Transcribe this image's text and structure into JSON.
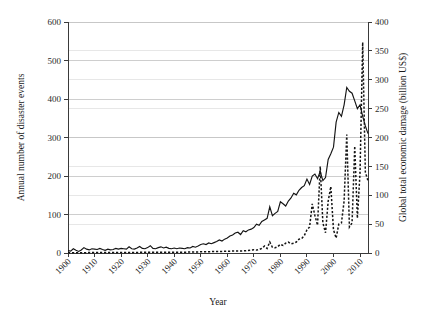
{
  "chart_data": {
    "type": "line",
    "title": "",
    "xlabel": "Year",
    "ylabel": "Annual number of disaster events",
    "ylabel_right": "Global total economic damage (billion US$)",
    "xlim": [
      1900,
      2013
    ],
    "ylim": [
      0,
      600
    ],
    "ylim_right": [
      0,
      400
    ],
    "xticks": [
      1900,
      1910,
      1920,
      1930,
      1940,
      1950,
      1960,
      1970,
      1980,
      1990,
      2000,
      2010
    ],
    "xtick_labels": [
      "1900",
      "1910",
      "1920",
      "1930",
      "1940",
      "1950",
      "1960",
      "1970",
      "1980",
      "1990",
      "2000",
      "2010"
    ],
    "yticks": [
      0,
      100,
      200,
      300,
      400,
      500,
      600
    ],
    "ytick_labels": [
      "0",
      "100",
      "200",
      "300",
      "400",
      "500",
      "600"
    ],
    "yticks_right": [
      0,
      50,
      100,
      150,
      200,
      250,
      300,
      350,
      400
    ],
    "ytick_labels_right": [
      "0",
      "50",
      "100",
      "150",
      "200",
      "250",
      "300",
      "350",
      "400"
    ],
    "grid": true,
    "legend": "none",
    "series": [
      {
        "name": "Annual number of disaster events",
        "axis": "left",
        "style": "solid",
        "x": [
          1900,
          1901,
          1902,
          1903,
          1904,
          1905,
          1906,
          1907,
          1908,
          1909,
          1910,
          1911,
          1912,
          1913,
          1914,
          1915,
          1916,
          1917,
          1918,
          1919,
          1920,
          1921,
          1922,
          1923,
          1924,
          1925,
          1926,
          1927,
          1928,
          1929,
          1930,
          1931,
          1932,
          1933,
          1934,
          1935,
          1936,
          1937,
          1938,
          1939,
          1940,
          1941,
          1942,
          1943,
          1944,
          1945,
          1946,
          1947,
          1948,
          1949,
          1950,
          1951,
          1952,
          1953,
          1954,
          1955,
          1956,
          1957,
          1958,
          1959,
          1960,
          1961,
          1962,
          1963,
          1964,
          1965,
          1966,
          1967,
          1968,
          1969,
          1970,
          1971,
          1972,
          1973,
          1974,
          1975,
          1976,
          1977,
          1978,
          1979,
          1980,
          1981,
          1982,
          1983,
          1984,
          1985,
          1986,
          1987,
          1988,
          1989,
          1990,
          1991,
          1992,
          1993,
          1994,
          1995,
          1996,
          1997,
          1998,
          1999,
          2000,
          2001,
          2002,
          2003,
          2004,
          2005,
          2006,
          2007,
          2008,
          2009,
          2010,
          2011,
          2012,
          2013
        ],
        "values": [
          6,
          5,
          11,
          7,
          4,
          8,
          14,
          10,
          8,
          11,
          10,
          9,
          12,
          9,
          7,
          10,
          8,
          9,
          12,
          10,
          12,
          11,
          10,
          16,
          11,
          10,
          13,
          17,
          12,
          11,
          14,
          19,
          12,
          11,
          14,
          16,
          13,
          15,
          12,
          11,
          13,
          11,
          13,
          12,
          11,
          14,
          13,
          17,
          15,
          18,
          22,
          24,
          22,
          26,
          24,
          27,
          30,
          34,
          31,
          36,
          39,
          44,
          47,
          52,
          54,
          48,
          58,
          55,
          60,
          62,
          66,
          75,
          72,
          82,
          86,
          90,
          120,
          97,
          103,
          108,
          133,
          128,
          122,
          135,
          143,
          155,
          151,
          163,
          170,
          175,
          192,
          178,
          200,
          205,
          193,
          212,
          188,
          196,
          243,
          258,
          275,
          340,
          365,
          355,
          385,
          430,
          420,
          415,
          395,
          375,
          385,
          355,
          330,
          310
        ]
      },
      {
        "name": "Global total economic damage (billion US$)",
        "axis": "right",
        "style": "dashed",
        "x": [
          1900,
          1905,
          1910,
          1915,
          1920,
          1925,
          1930,
          1935,
          1940,
          1945,
          1950,
          1955,
          1960,
          1963,
          1965,
          1967,
          1969,
          1970,
          1971,
          1972,
          1973,
          1974,
          1975,
          1976,
          1977,
          1978,
          1979,
          1980,
          1981,
          1982,
          1983,
          1984,
          1985,
          1986,
          1987,
          1988,
          1989,
          1990,
          1991,
          1992,
          1993,
          1994,
          1995,
          1996,
          1997,
          1998,
          1999,
          2000,
          2001,
          2002,
          2003,
          2004,
          2005,
          2006,
          2007,
          2008,
          2009,
          2010,
          2011,
          2012,
          2013
        ],
        "values": [
          0.5,
          0.5,
          0.8,
          0.8,
          1.0,
          1.0,
          1.2,
          1.2,
          1.5,
          1.5,
          2.0,
          2.5,
          3.0,
          3.5,
          3.5,
          4.0,
          5.0,
          5.5,
          5.0,
          6.0,
          8.0,
          12.0,
          8.0,
          19.0,
          10.0,
          9.0,
          11.0,
          15.0,
          13.0,
          17.0,
          19.0,
          16.0,
          17.0,
          19.0,
          24.0,
          25.0,
          30.0,
          40.0,
          45.0,
          85.0,
          65.0,
          48.0,
          150.0,
          52.0,
          35.0,
          90.0,
          115.0,
          40.0,
          26.0,
          50.0,
          52.0,
          90.0,
          205.0,
          45.0,
          52.0,
          185.0,
          60.0,
          140.0,
          365.0,
          140.0,
          125.0
        ]
      }
    ]
  }
}
